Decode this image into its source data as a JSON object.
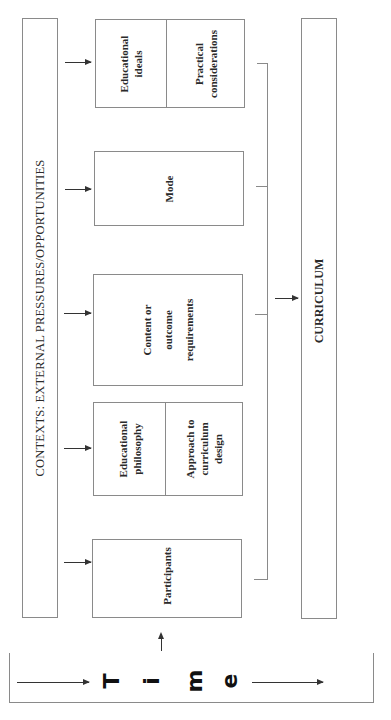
{
  "context": {
    "label": "CONTEXTS:  EXTERNAL PRESSURES/OPPORTUNITIES"
  },
  "boxes": [
    {
      "id": "box-1",
      "parts": [
        "Educational\nideals",
        "Practical\nconsiderations"
      ]
    },
    {
      "id": "box-2",
      "parts": [
        "Mode"
      ]
    },
    {
      "id": "box-3",
      "parts": [
        "Content or outcome requirements"
      ]
    },
    {
      "id": "box-4",
      "parts": [
        "Educational\nphilosophy",
        "Approach to\ncurriculum\ndesign"
      ]
    },
    {
      "id": "box-5",
      "parts": [
        "Participants"
      ]
    }
  ],
  "labels": {
    "box1_left_line1": "Educational",
    "box1_left_line2": "ideals",
    "box1_right_line1": "Practical",
    "box1_right_line2": "considerations",
    "box2": "Mode",
    "box3_line1": "Content or",
    "box3_line2": "outcome",
    "box3_line3": "requirements",
    "box4_left_line1": "Educational",
    "box4_left_line2": "philosophy",
    "box4_right_line1": "Approach to",
    "box4_right_line2": "curriculum",
    "box4_right_line3": "design",
    "box5": "Participants"
  },
  "curriculum": {
    "label": "CURRICULUM"
  },
  "time": {
    "letters": [
      "T",
      "i",
      "m",
      "e"
    ],
    "word": "Time"
  },
  "colors": {
    "line": "#8a8a8a",
    "arrow": "#333333",
    "text": "#2a2a2a",
    "background": "#ffffff"
  }
}
